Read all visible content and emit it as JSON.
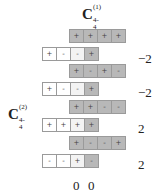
{
  "title": {
    "base": "C",
    "sup": "(1)",
    "sub": "4-4"
  },
  "side_label": {
    "base": "C",
    "sup": "(2)",
    "sub": "4-4"
  },
  "groups": [
    {
      "top": {
        "y": 29,
        "cells": [
          "+",
          "+",
          "+",
          "+"
        ]
      },
      "bottom": {
        "y": 47,
        "cells": [
          "+",
          "-",
          "-",
          "+"
        ]
      },
      "value": "−2",
      "value_y": 51
    },
    {
      "top": {
        "y": 64,
        "cells": [
          "+",
          "-",
          "+",
          "-"
        ]
      },
      "bottom": {
        "y": 82,
        "cells": [
          "+",
          "-",
          "-",
          "+"
        ]
      },
      "value": "−2",
      "value_y": 85
    },
    {
      "top": {
        "y": 100,
        "cells": [
          "+",
          "+",
          "-",
          "-"
        ]
      },
      "bottom": {
        "y": 118,
        "cells": [
          "+",
          "+",
          "+",
          "+"
        ]
      },
      "value": "2",
      "value_y": 121
    },
    {
      "top": {
        "y": 136,
        "cells": [
          "+",
          "-",
          "-",
          "+"
        ]
      },
      "bottom": {
        "y": 154,
        "cells": [
          "-",
          "-",
          "+",
          "-"
        ]
      },
      "value": "2",
      "value_y": 157
    }
  ],
  "bottom_values": [
    "0",
    "0"
  ],
  "colors": {
    "gray_cell": "#b8b8b8",
    "white_cell": "#ffffff",
    "light_cell": "#f3f3f3",
    "border": "#9a9a9a"
  }
}
